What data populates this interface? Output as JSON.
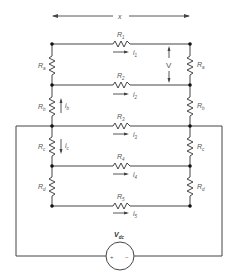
{
  "diagram": {
    "dimension_label": "x",
    "voltage_label": "V",
    "source": {
      "label": "V",
      "subscript": "dc",
      "plus": "+",
      "minus": "−"
    },
    "horizontal_resistors": [
      {
        "label": "R",
        "sub": "1",
        "current": "i",
        "current_sub": "1"
      },
      {
        "label": "R",
        "sub": "2",
        "current": "i",
        "current_sub": "2"
      },
      {
        "label": "R",
        "sub": "3",
        "current": "i",
        "current_sub": "3"
      },
      {
        "label": "R",
        "sub": "4",
        "current": "i",
        "current_sub": "4"
      },
      {
        "label": "R",
        "sub": "5",
        "current": "i",
        "current_sub": "5"
      }
    ],
    "left_resistors": [
      {
        "label": "R",
        "sub": "a"
      },
      {
        "label": "R",
        "sub": "b",
        "current": "i",
        "current_sub": "b"
      },
      {
        "label": "R",
        "sub": "c",
        "current": "i",
        "current_sub": "c"
      },
      {
        "label": "R",
        "sub": "d"
      }
    ],
    "right_resistors": [
      {
        "label": "R",
        "sub": "a"
      },
      {
        "label": "R",
        "sub": "b"
      },
      {
        "label": "R",
        "sub": "c"
      },
      {
        "label": "R",
        "sub": "d"
      }
    ],
    "colors": {
      "wire": "#444444",
      "text": "#555555",
      "background": "#ffffff"
    }
  }
}
